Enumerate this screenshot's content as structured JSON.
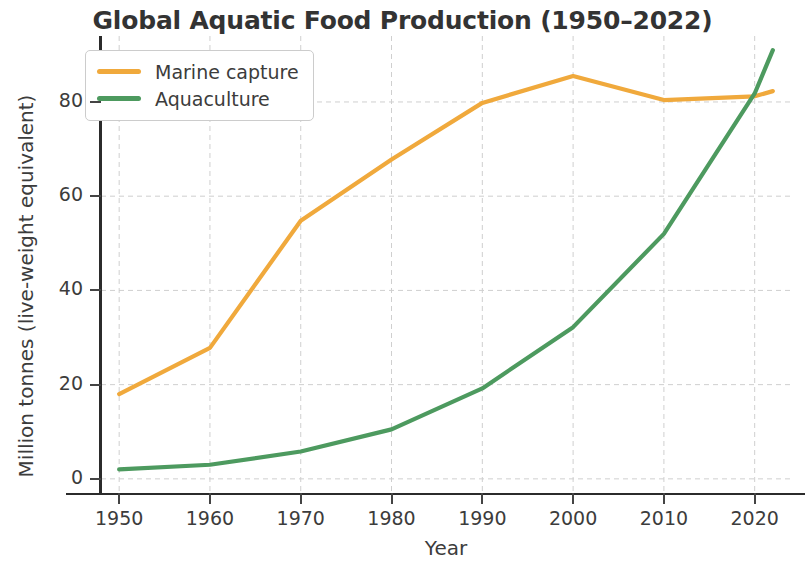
{
  "chart_data": {
    "type": "line",
    "title": "Global Aquatic Food Production (1950–2022)",
    "xlabel": "Year",
    "ylabel": "Million tonnes (live-weight equivalent)",
    "xlim": [
      1948,
      2024
    ],
    "ylim": [
      -3,
      94
    ],
    "grid": true,
    "grid_style": "dashed",
    "legend_position": "upper left",
    "xticks": [
      1950,
      1960,
      1970,
      1980,
      1990,
      2000,
      2010,
      2020
    ],
    "xtick_labels": [
      "1950",
      "1960",
      "1970",
      "1980",
      "1990",
      "2000",
      "2010",
      "2020"
    ],
    "yticks": [
      0,
      20,
      40,
      60,
      80
    ],
    "ytick_labels": [
      "0",
      "20",
      "40",
      "60",
      "80"
    ],
    "x": [
      1950,
      1960,
      1970,
      1980,
      1990,
      2000,
      2010,
      2020,
      2022
    ],
    "series": [
      {
        "name": "Marine capture",
        "color": "#f0a93c",
        "values": [
          18.0,
          27.8,
          54.8,
          67.8,
          79.8,
          85.5,
          80.4,
          81.2,
          82.3
        ]
      },
      {
        "name": "Aquaculture",
        "color": "#4d9a5f",
        "values": [
          2.0,
          3.0,
          5.8,
          10.5,
          19.2,
          32.2,
          52.0,
          81.8,
          91.0
        ]
      }
    ]
  },
  "colors": {
    "marine_capture": "#f0a93c",
    "aquaculture": "#4d9a5f",
    "axis": "#2b2b2b",
    "grid": "#cfcfcf",
    "text": "#3c3c3c",
    "background": "#ffffff"
  },
  "legend": {
    "items": [
      {
        "label": "Marine capture",
        "color": "#f0a93c"
      },
      {
        "label": "Aquaculture",
        "color": "#4d9a5f"
      }
    ]
  }
}
